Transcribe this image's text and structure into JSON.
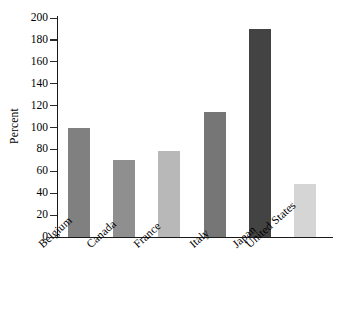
{
  "chart_data": {
    "type": "bar",
    "title": "",
    "xlabel": "",
    "ylabel": "Percent",
    "ylim": [
      0,
      200
    ],
    "ytick_step": 20,
    "grid": false,
    "legend": "none",
    "categories": [
      "Belgium",
      "Canada",
      "France",
      "Italy",
      "Japan",
      "United States"
    ],
    "values": [
      100,
      70,
      79,
      114,
      190,
      48
    ],
    "ytick_labels": [
      "0",
      "20",
      "40",
      "60",
      "80",
      "100",
      "120",
      "140",
      "160",
      "180",
      "200"
    ],
    "bar_colors": [
      "#808080",
      "#8f8f8f",
      "#b8b8b8",
      "#767676",
      "#434343",
      "#d5d5d5"
    ],
    "bars": [
      {
        "category": "Belgium",
        "value": 100,
        "color": "#808080"
      },
      {
        "category": "Canada",
        "value": 70,
        "color": "#8f8f8f"
      },
      {
        "category": "France",
        "value": 79,
        "color": "#b8b8b8"
      },
      {
        "category": "Italy",
        "value": 114,
        "color": "#767676"
      },
      {
        "category": "Japan",
        "value": 190,
        "color": "#434343"
      },
      {
        "category": "United States",
        "value": 48,
        "color": "#d5d5d5"
      }
    ],
    "axis_color": "#1a1a1a"
  }
}
